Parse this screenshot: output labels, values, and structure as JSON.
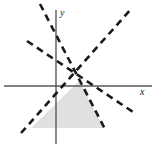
{
  "figure": {
    "kind": "coordinate-plane-diagram",
    "width": 156,
    "height": 154,
    "background_color": "#ffffff"
  },
  "axes": {
    "x_axis": {
      "label": "x",
      "label_x": 140,
      "label_y": 87,
      "color": "#595959",
      "stroke_width": 1.4,
      "y_position": 86,
      "x_start": 4,
      "x_end": 152
    },
    "y_axis": {
      "label": "y",
      "label_x": 60,
      "label_y": 8,
      "color": "#595959",
      "stroke_width": 1.4,
      "x_position": 56,
      "y_start": 10,
      "y_end": 144
    },
    "origin": {
      "x": 56,
      "y": 86
    }
  },
  "chart_data": {
    "type": "line",
    "title": "",
    "xlabel": "x",
    "ylabel": "y",
    "grid": false,
    "legend": null,
    "boundary_lines": [
      {
        "name": "steep-descending-line",
        "style": "dashed",
        "color": "#1a1a1a",
        "stroke_width": 2.6,
        "dash_pattern": "7,5",
        "x1": 40,
        "y1": 4,
        "x2": 106,
        "y2": 131
      },
      {
        "name": "shallow-descending-line",
        "style": "dashed",
        "color": "#1a1a1a",
        "stroke_width": 2.6,
        "dash_pattern": "7,5",
        "x1": 27,
        "y1": 41,
        "x2": 133,
        "y2": 112
      },
      {
        "name": "ascending-line",
        "style": "dashed",
        "color": "#1a1a1a",
        "stroke_width": 2.6,
        "dash_pattern": "7,5",
        "x1": 21,
        "y1": 133,
        "x2": 131,
        "y2": 9
      }
    ],
    "shaded_region": {
      "name": "feasible-region",
      "fill_color": "#e0e0e0",
      "opacity": 1,
      "polygon": [
        [
          31,
          128
        ],
        [
          79,
          81
        ],
        [
          104,
          128
        ]
      ]
    },
    "intersection_points": [
      {
        "x": 79,
        "y": 81
      },
      {
        "x": 70,
        "y": 70
      },
      {
        "x": 89,
        "y": 87
      }
    ]
  }
}
